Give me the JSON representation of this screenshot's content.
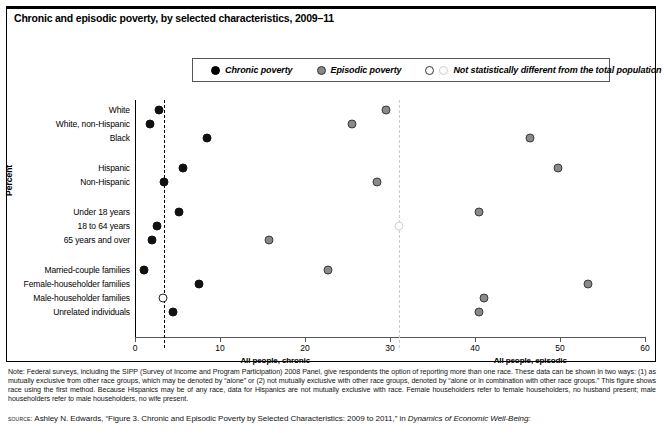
{
  "figure": {
    "title": "Chronic and episodic poverty, by selected characteristics, 2009–11",
    "y_axis_title": "Percent"
  },
  "legend": {
    "items": [
      {
        "label": "Chronic poverty",
        "marker": "filled-black-circle-icon",
        "color": "#000000"
      },
      {
        "label": "Episodic poverty",
        "marker": "filled-gray-circle-icon",
        "color": "#888888"
      },
      {
        "label": "Not statistically different from the total population",
        "marker": "open-circle-icon",
        "color": "#ffffff"
      }
    ]
  },
  "chart_data": {
    "type": "scatter",
    "title": "Chronic and episodic poverty, by selected characteristics, 2009–11",
    "xlabel": "",
    "ylabel": "Percent",
    "xlim": [
      0,
      60
    ],
    "xticks": [
      0,
      10,
      20,
      30,
      40,
      50,
      60
    ],
    "xtick_labels": [
      "0",
      "10",
      "20",
      "30",
      "40",
      "50",
      "60"
    ],
    "grid": false,
    "legend_position": "top",
    "categories": [
      "White",
      "White, non-Hispanic",
      "Black",
      "Hispanic",
      "Non-Hispanic",
      "Under 18 years",
      "18 to 64 years",
      "65 years and over",
      "Married-couple families",
      "Female-householder families",
      "Male-householder families",
      "Unrelated individuals"
    ],
    "series": [
      {
        "name": "Chronic poverty",
        "color": "#111111",
        "values": [
          2.8,
          1.8,
          8.5,
          5.6,
          3.4,
          5.2,
          2.6,
          2.0,
          1.0,
          7.5,
          3.3,
          4.5
        ],
        "not_significant": [
          false,
          false,
          false,
          false,
          false,
          false,
          false,
          false,
          false,
          false,
          true,
          false
        ]
      },
      {
        "name": "Episodic poverty",
        "color": "#8a8a8a",
        "values": [
          29.5,
          25.5,
          46.5,
          49.8,
          28.5,
          40.5,
          31.0,
          15.8,
          22.7,
          53.3,
          41.0,
          40.5
        ],
        "not_significant": [
          false,
          false,
          false,
          false,
          false,
          false,
          true,
          false,
          false,
          false,
          false,
          false
        ]
      }
    ],
    "reference_lines": [
      {
        "label": "All people, chronic",
        "value": 3.4,
        "style": "dashed",
        "color": "#000000"
      },
      {
        "label": "All people, episodic",
        "value": 31.0,
        "style": "dashed",
        "color": "#cccccc"
      }
    ]
  },
  "notes": {
    "note_text": "Note: Federal surveys, including the SIPP (Survey of Income and Program Participation) 2008 Panel, give respondents the option of reporting more than one race. These data can be shown in two ways: (1) as mutually exclusive from other race groups, which may be denoted by “alone” or (2) not mutually exclusive with other race groups, denoted by “alone or in combination with other race groups.” This figure shows race using the first method. Because Hispanics may be of any race, data for Hispanics are not mutually exclusive with race. Female householders refer to female householders, no husband present; male householders refer to male householders, no wife present.",
    "source_prefix": "source:",
    "source_text": " Ashley N. Edwards, “Figure 3. Chronic and Episodic Poverty by Selected Characteristics: 2009 to 2011,” in ",
    "source_italic": "Dynamics of Economic Well-Being:"
  }
}
